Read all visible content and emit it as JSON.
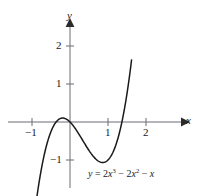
{
  "chart_data": {
    "type": "line",
    "title": "",
    "subtitle": "",
    "xlabel": "x",
    "ylabel": "y",
    "equation_label": "y = 2x³ − 2x² − x",
    "equation_parts": {
      "lhs": "y",
      "equals": "=",
      "term1_coef": "2",
      "term1_var": "x",
      "term1_exp": "3",
      "op1": "−",
      "term2_coef": "2",
      "term2_var": "x",
      "term2_exp": "2",
      "op2": "−",
      "term3_var": "x"
    },
    "function": "y = 2x^3 - 2x^2 - x",
    "xlim": [
      -1.45,
      2.6
    ],
    "ylim": [
      -1.9,
      2.45
    ],
    "grid": false,
    "legend": null,
    "axis_arrows": [
      "x-positive",
      "y-positive"
    ],
    "xticks": [
      -1,
      1,
      2
    ],
    "xtick_labels": [
      "−1",
      "1",
      "2"
    ],
    "yticks": [
      2,
      1,
      -1
    ],
    "ytick_labels": [
      "2",
      "1",
      "−1"
    ],
    "roots": [
      -0.5,
      0,
      1
    ],
    "local_maximum": {
      "x": -0.215,
      "y": 0.115
    },
    "local_minimum": {
      "x": 0.77,
      "y": -0.841
    },
    "points": [
      {
        "x": -1.0,
        "y": -3.0
      },
      {
        "x": -0.9,
        "y": -2.63
      },
      {
        "x": -0.8,
        "y": -2.24
      },
      {
        "x": -0.7,
        "y": -1.86
      },
      {
        "x": -0.6,
        "y": -1.51
      },
      {
        "x": -0.5,
        "y": -1.25
      },
      {
        "x": -0.4,
        "y": -0.91
      },
      {
        "x": -0.3,
        "y": -0.56
      },
      {
        "x": -0.2,
        "y": -0.3
      },
      {
        "x": -0.1,
        "y": -0.07
      },
      {
        "x": 0.0,
        "y": 0.0
      },
      {
        "x": 0.1,
        "y": -0.12
      },
      {
        "x": 0.2,
        "y": -0.26
      },
      {
        "x": 0.3,
        "y": -0.41
      },
      {
        "x": 0.4,
        "y": -0.58
      },
      {
        "x": 0.5,
        "y": -0.75
      },
      {
        "x": 0.6,
        "y": -0.89
      },
      {
        "x": 0.7,
        "y": -0.99
      },
      {
        "x": 0.8,
        "y": -1.02
      },
      {
        "x": 0.9,
        "y": -0.94
      },
      {
        "x": 1.0,
        "y": -0.73
      },
      {
        "x": 1.1,
        "y": -0.38
      },
      {
        "x": 1.2,
        "y": 0.14
      },
      {
        "x": 1.3,
        "y": 0.82
      },
      {
        "x": 1.4,
        "y": 1.7
      },
      {
        "x": 1.5,
        "y": 2.78
      },
      {
        "x": 1.55,
        "y": 3.41
      }
    ],
    "axes": {
      "x_axis_pixel_y": 122,
      "y_axis_pixel_x": 70,
      "unit_pixels": 38
    },
    "colors": {
      "curve": "#1a1a1a",
      "axis": "#6b6b75",
      "tick": "#6b6b75",
      "text": "#1a1a1a",
      "background": "#ffffff"
    }
  }
}
